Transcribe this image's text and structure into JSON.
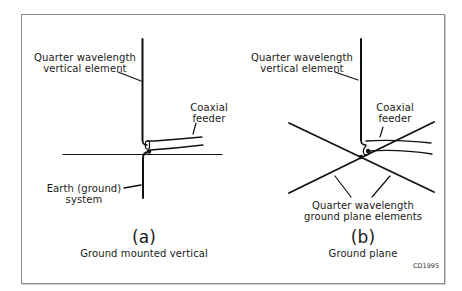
{
  "figure": {
    "code": "CD1995",
    "border_color": "#8a8a8a",
    "line_color": "#111111"
  },
  "diagram_a": {
    "vertical_element_label": "Quarter wavelength\nvertical element",
    "coax_label": "Coaxial\nfeeder",
    "earth_label": "Earth (ground)\nsystem",
    "letter": "(a)",
    "caption": "Ground mounted vertical"
  },
  "diagram_b": {
    "vertical_element_label": "Quarter wavelength\nvertical element",
    "coax_label": "Coaxial\nfeeder",
    "ground_plane_label": "Quarter wavelength\nground plane elements",
    "letter": "(b)",
    "caption": "Ground plane"
  }
}
